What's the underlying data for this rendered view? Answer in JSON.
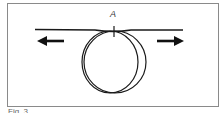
{
  "figure": {
    "point_label": "A",
    "caption": "Fig. 3",
    "colors": {
      "stroke": "#1a1a1a",
      "frame": "#8a8a8a",
      "background": "#ffffff"
    },
    "arrows": [
      {
        "direction": "left"
      },
      {
        "direction": "right"
      }
    ]
  }
}
